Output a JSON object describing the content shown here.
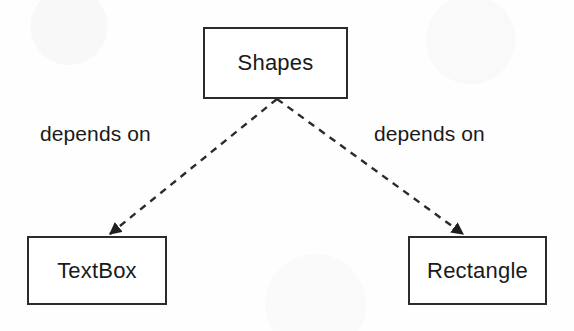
{
  "diagram": {
    "type": "dependency-graph",
    "background_color": "#fefefe",
    "stroke_color": "#2b2b2b",
    "text_color": "#1a1a1a",
    "nodes": [
      {
        "id": "shapes",
        "label": "Shapes",
        "x": 203,
        "y": 27,
        "width": 145,
        "height": 72
      },
      {
        "id": "textbox",
        "label": "TextBox",
        "x": 27,
        "y": 236,
        "width": 140,
        "height": 69
      },
      {
        "id": "rectangle",
        "label": "Rectangle",
        "x": 408,
        "y": 236,
        "width": 139,
        "height": 69
      }
    ],
    "edges": [
      {
        "id": "shapes-to-textbox",
        "from": "shapes",
        "to": "textbox",
        "label": "depends on",
        "style": "dashed",
        "arrowhead": "filled-triangle",
        "x1": 277,
        "y1": 99,
        "x2": 108,
        "y2": 236
      },
      {
        "id": "shapes-to-rectangle",
        "from": "shapes",
        "to": "rectangle",
        "label": "depends on",
        "style": "dashed",
        "arrowhead": "filled-triangle",
        "x1": 277,
        "y1": 99,
        "x2": 465,
        "y2": 236
      }
    ]
  }
}
